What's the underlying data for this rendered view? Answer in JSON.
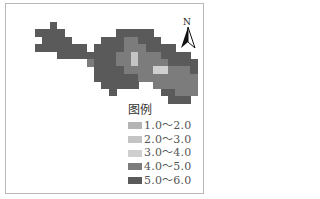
{
  "map": {
    "title_legend": "图例",
    "north_label": "N",
    "colors": {
      "1": "#b4b4b4",
      "2": "#c4c4c4",
      "3": "#cfcfcf",
      "4": "#7c7c7c",
      "5": "#5a5a5a"
    },
    "grid_origin": [
      20,
      22
    ],
    "cell_size": 7.4,
    "grid": [
      [
        0,
        0,
        0,
        0,
        5,
        0,
        0,
        0,
        0,
        0,
        0,
        0,
        0,
        0,
        0,
        0,
        0,
        0,
        0,
        0,
        0,
        0,
        0,
        0
      ],
      [
        0,
        0,
        5,
        5,
        5,
        5,
        0,
        0,
        0,
        0,
        0,
        0,
        0,
        5,
        5,
        5,
        5,
        5,
        0,
        0,
        0,
        0,
        0,
        0
      ],
      [
        0,
        0,
        0,
        5,
        5,
        5,
        5,
        0,
        0,
        0,
        0,
        5,
        5,
        5,
        4,
        4,
        5,
        5,
        5,
        0,
        0,
        0,
        0,
        0
      ],
      [
        0,
        0,
        5,
        5,
        5,
        5,
        5,
        5,
        5,
        0,
        5,
        5,
        5,
        5,
        4,
        4,
        4,
        5,
        5,
        5,
        5,
        0,
        0,
        0
      ],
      [
        0,
        0,
        0,
        0,
        0,
        5,
        5,
        5,
        5,
        5,
        5,
        5,
        5,
        4,
        4,
        2,
        4,
        4,
        4,
        5,
        5,
        5,
        5,
        0
      ],
      [
        0,
        0,
        0,
        0,
        0,
        0,
        0,
        0,
        0,
        4,
        5,
        5,
        5,
        4,
        4,
        2,
        4,
        4,
        4,
        4,
        5,
        5,
        5,
        5
      ],
      [
        0,
        0,
        0,
        0,
        0,
        0,
        0,
        0,
        0,
        0,
        5,
        5,
        5,
        5,
        4,
        4,
        4,
        4,
        3,
        3,
        4,
        4,
        4,
        5
      ],
      [
        0,
        0,
        0,
        0,
        0,
        0,
        0,
        0,
        0,
        0,
        5,
        5,
        5,
        5,
        5,
        5,
        4,
        4,
        4,
        4,
        4,
        4,
        4,
        4
      ],
      [
        0,
        0,
        0,
        0,
        0,
        0,
        0,
        0,
        0,
        0,
        0,
        5,
        5,
        5,
        5,
        5,
        0,
        0,
        4,
        4,
        4,
        4,
        4,
        4
      ],
      [
        0,
        0,
        0,
        0,
        0,
        0,
        0,
        0,
        0,
        0,
        0,
        0,
        5,
        0,
        0,
        0,
        0,
        0,
        0,
        5,
        5,
        4,
        4,
        4
      ],
      [
        0,
        0,
        0,
        0,
        0,
        0,
        0,
        0,
        0,
        0,
        0,
        0,
        0,
        0,
        0,
        0,
        0,
        0,
        0,
        0,
        5,
        5,
        5,
        0
      ]
    ],
    "legend": [
      {
        "label": "1.0～2.0",
        "class": "1",
        "color": "#b4b4b4"
      },
      {
        "label": "2.0～3.0",
        "class": "2",
        "color": "#c4c4c4"
      },
      {
        "label": "3.0～4.0",
        "class": "3",
        "color": "#cfcfcf"
      },
      {
        "label": "4.0～5.0",
        "class": "4",
        "color": "#7c7c7c"
      },
      {
        "label": "5.0～6.0",
        "class": "5",
        "color": "#5a5a5a"
      }
    ]
  }
}
